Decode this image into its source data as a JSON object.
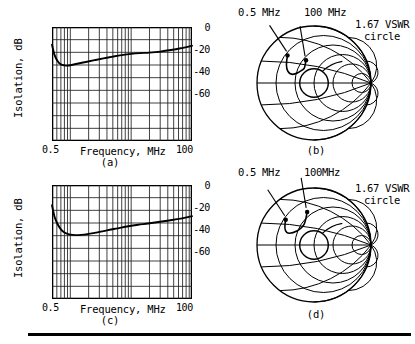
{
  "figure": {
    "panels": [
      "a",
      "b",
      "c",
      "d"
    ],
    "tag_a": "(a)",
    "tag_b": "(b)",
    "tag_c": "(c)",
    "tag_d": "(d)"
  },
  "chart_data": [
    {
      "panel": "a",
      "type": "line",
      "title": "",
      "xlabel": "Frequency, MHz",
      "ylabel": "Isolation, dB",
      "xscale": "log",
      "xlim": [
        0.5,
        100
      ],
      "ylim": [
        -90,
        0
      ],
      "xticks": [
        0.5,
        100
      ],
      "xticklabels": [
        "0.5",
        "100"
      ],
      "yticks": [
        0,
        -20,
        -40,
        -60
      ],
      "yticklabels": [
        "0",
        "-20",
        "-40",
        "-60"
      ],
      "grid": true,
      "legend": "none",
      "series": [
        {
          "name": "Isolation",
          "x": [
            0.5,
            0.55,
            0.62,
            0.7,
            0.8,
            0.9,
            1.0,
            1.3,
            1.8,
            2.5,
            3.5,
            5.0,
            7.0,
            10,
            14,
            20,
            30,
            45,
            65,
            100
          ],
          "values": [
            -14,
            -22,
            -27,
            -29.5,
            -30.3,
            -30.5,
            -30.2,
            -29,
            -27.6,
            -26.2,
            -24.8,
            -23.4,
            -22.2,
            -21.2,
            -20.6,
            -20.2,
            -19.4,
            -18.2,
            -16.8,
            -14.8
          ]
        }
      ]
    },
    {
      "panel": "c",
      "type": "line",
      "title": "",
      "xlabel": "Frequency, MHz",
      "ylabel": "Isolation, dB",
      "xscale": "log",
      "xlim": [
        0.5,
        100
      ],
      "ylim": [
        -90,
        0
      ],
      "xticks": [
        0.5,
        100
      ],
      "xticklabels": [
        "0.5",
        "100"
      ],
      "yticks": [
        0,
        -20,
        -40,
        -60
      ],
      "yticklabels": [
        "0",
        "-20",
        "-40",
        "-60"
      ],
      "grid": true,
      "legend": "none",
      "series": [
        {
          "name": "Isolation",
          "x": [
            0.5,
            0.55,
            0.62,
            0.7,
            0.8,
            0.9,
            1.0,
            1.2,
            1.5,
            2.0,
            2.8,
            4.0,
            6.0,
            9.0,
            13,
            19,
            28,
            42,
            65,
            100
          ],
          "values": [
            -16,
            -25,
            -31,
            -35,
            -37.5,
            -38.6,
            -39.2,
            -39.6,
            -39.4,
            -38.6,
            -37.4,
            -35.8,
            -34.2,
            -32.6,
            -31.4,
            -30.4,
            -29.2,
            -28.0,
            -26.6,
            -24.6
          ]
        }
      ]
    },
    {
      "panel": "b",
      "type": "smith",
      "title": "",
      "marker_labels": [
        "0.5 MHz",
        "100 MHz"
      ],
      "vswr_label_line1": "1.67 VSWR",
      "vswr_label_line2": "circle",
      "vswr": 1.67,
      "markers": [
        {
          "label": "0.5 MHz",
          "x": 0.268,
          "y": 0.742
        },
        {
          "label": "100 MHz",
          "x": 0.43,
          "y": 0.7
        }
      ]
    },
    {
      "panel": "d",
      "type": "smith",
      "title": "",
      "marker_labels": [
        "0.5 MHz",
        "100MHz"
      ],
      "vswr_label_line1": "1.67 VSWR",
      "vswr_label_line2": "circle",
      "vswr": 1.67,
      "markers": [
        {
          "label": "0.5 MHz",
          "x": 0.252,
          "y": 0.722
        },
        {
          "label": "100MHz",
          "x": 0.44,
          "y": 0.79
        }
      ]
    }
  ],
  "panel_a": {
    "ylabel": "Isolation, dB",
    "xlabel": "Frequency, MHz",
    "ytick_0": "0",
    "ytick_1": "-20",
    "ytick_2": "-40",
    "ytick_3": "-60",
    "xtick_left": "0.5",
    "xtick_right": "100",
    "tag": "(a)"
  },
  "panel_c": {
    "ylabel": "Isolation, dB",
    "xlabel": "Frequency, MHz",
    "ytick_0": "0",
    "ytick_1": "-20",
    "ytick_2": "-40",
    "ytick_3": "-60",
    "xtick_left": "0.5",
    "xtick_right": "100",
    "tag": "(c)"
  },
  "panel_b": {
    "label_low": "0.5 MHz",
    "label_high": "100 MHz",
    "vswr_line1": "1.67 VSWR",
    "vswr_line2": "circle",
    "tag": "(b)"
  },
  "panel_d": {
    "label_low": "0.5 MHz",
    "label_high": "100MHz",
    "vswr_line1": "1.67 VSWR",
    "vswr_line2": "circle",
    "tag": "(d)"
  },
  "colors": {
    "ink": "#000000",
    "grid": "#1a1a1a",
    "background": "#ffffff"
  }
}
